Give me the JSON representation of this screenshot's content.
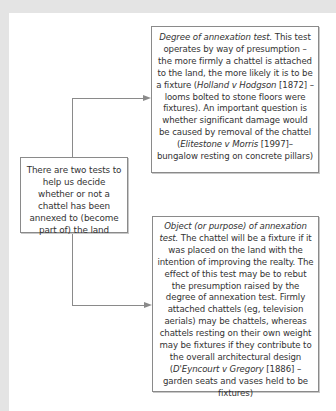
{
  "diagram": {
    "center": {
      "text": "There are two tests to help us decide whether or not a chattel has been annexed to (become part of) the land"
    },
    "top": {
      "title": "Degree of annexation test.",
      "text1": " This test operates by way of presumption – the more firmly a chattel is attached to the land, the more likely it is to be a fixture (",
      "case1": "Holland v Hodgson",
      "text2": " [1872] – looms bolted to stone floors were fixtures). An important question is whether significant damage would be caused by removal of the chattel (",
      "case2": "Elitestone v Morris",
      "text3": " [1997]– bungalow resting on concrete pillars)"
    },
    "bottom": {
      "title": "Object (or purpose) of annexation test.",
      "text1": " The chattel will be a fixture if it was placed on the land with the intention of improving the realty. The effect of this test may be to rebut the presumption raised by the degree of annexation test. Firmly attached chattels (eg, television aerials) may be chattels, whereas chattels resting on their own weight may be fixtures if they contribute to the overall architectural design (",
      "case1": "D'Eyncourt v Gregory",
      "text2": " [1886] – garden seats and vases held to be fixtures)"
    },
    "colors": {
      "line": "#8a8a8a",
      "background": "#e4e4e4",
      "panel": "#ffffff"
    }
  }
}
